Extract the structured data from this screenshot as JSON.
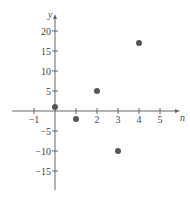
{
  "chart_data": {
    "type": "scatter",
    "title": "",
    "xlabel": "n",
    "ylabel": "y",
    "xlim": [
      -1.8,
      5.8
    ],
    "ylim": [
      -19,
      24
    ],
    "x_ticks": [
      -1,
      1,
      2,
      3,
      4,
      5
    ],
    "x_tick_labels": [
      "−1",
      "",
      "2",
      "3",
      "4",
      "5"
    ],
    "y_ticks": [
      20,
      15,
      10,
      5,
      -5,
      -10,
      -15
    ],
    "y_tick_labels": [
      "20",
      "15",
      "10",
      "5",
      "−5",
      "−10",
      "−15"
    ],
    "grid": false,
    "series": [
      {
        "name": "points",
        "x": [
          0,
          1,
          2,
          3,
          4
        ],
        "y": [
          1,
          -2,
          5,
          -10,
          17
        ],
        "color": "#555555"
      }
    ]
  }
}
